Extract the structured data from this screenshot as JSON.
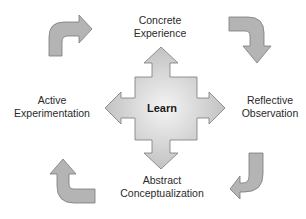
{
  "diagram": {
    "type": "cycle",
    "center": {
      "label": "Learn"
    },
    "stages": [
      {
        "id": "concrete-experience",
        "line1": "Concrete",
        "line2": "Experience",
        "position": "top"
      },
      {
        "id": "reflective-observation",
        "line1": "Reflective",
        "line2": "Observation",
        "position": "right"
      },
      {
        "id": "abstract-conceptualization",
        "line1": "Abstract",
        "line2": "Conceptualization",
        "position": "bottom"
      },
      {
        "id": "active-experimentation",
        "line1": "Active",
        "line2": "Experimentation",
        "position": "left"
      }
    ],
    "cycle_arrows": [
      {
        "position": "top-left",
        "direction": "up-then-right"
      },
      {
        "position": "top-right",
        "direction": "right-then-down"
      },
      {
        "position": "bottom-right",
        "direction": "down-then-left"
      },
      {
        "position": "bottom-left",
        "direction": "right-then-up"
      }
    ],
    "colors": {
      "arrow_fill": "#b4b4b4",
      "arrow_stroke": "#7a7a7a",
      "center_fill_light": "#f2f2f2",
      "center_fill_dark": "#b8b8b8",
      "text": "#2a2a2a"
    }
  }
}
